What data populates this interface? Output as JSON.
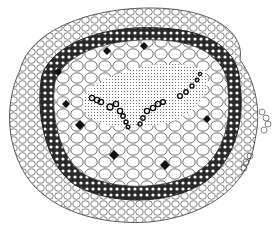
{
  "image": {
    "subject": "cross-section of plant stem",
    "style": "black ink line drawing",
    "background": "#ffffff",
    "ink": "#1a1a1a"
  },
  "regions": [
    {
      "name": "outer-cortex",
      "description": "loose ring of pale rounded cells"
    },
    {
      "name": "dark-ring",
      "description": "dense band of dark thick-walled cells"
    },
    {
      "name": "inner-parenchyma",
      "description": "large polygonal cells with black intercellular spaces"
    },
    {
      "name": "vascular-center",
      "description": "stippled central region with chains of ring-shaped vessels"
    }
  ]
}
